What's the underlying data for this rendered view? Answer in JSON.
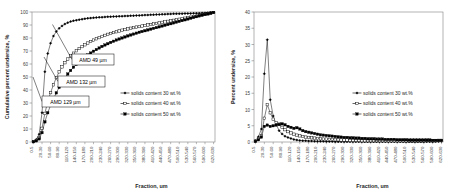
{
  "figure": {
    "background": "#ffffff",
    "line_color": "#000000",
    "axis_color": "#808080",
    "gridline_color": "#d9d9d9"
  },
  "panels": [
    {
      "id": "left",
      "name": "cumulative-undersize-chart",
      "chart_index": 0
    },
    {
      "id": "right",
      "name": "percent-undersize-chart",
      "chart_index": 1
    }
  ],
  "chart_data": [
    {
      "type": "line",
      "title": "",
      "xlabel": "Fraction, um",
      "ylabel": "Cumulative percent undersize, %",
      "ylim": [
        0,
        100
      ],
      "yticks": [
        0,
        10,
        20,
        30,
        40,
        50,
        60,
        70,
        80,
        90,
        100
      ],
      "grid": false,
      "legend_position": "center-right",
      "categories": [
        "0-5",
        "20-30",
        "50-60",
        "80-90",
        "110-120",
        "140-150",
        "170-180",
        "200-210",
        "230-240",
        "260-270",
        "290-300",
        "320-330",
        "350-360",
        "380-390",
        "410-420",
        "440-450",
        "470-480",
        "500-510",
        "530-540",
        "560-570",
        "590-600",
        "620-630"
      ],
      "x_tick_every": 3,
      "x_points": 64,
      "series": [
        {
          "name": "solids content 30 wt.%",
          "marker": "diamond",
          "values": [
            0.4,
            2.0,
            6.0,
            22.5,
            54.0,
            68.0,
            76.0,
            81.5,
            85.0,
            87.5,
            89.3,
            90.7,
            91.8,
            92.6,
            93.2,
            93.7,
            94.1,
            94.5,
            94.8,
            95.1,
            95.3,
            95.5,
            95.7,
            95.9,
            96.0,
            96.2,
            96.3,
            96.4,
            96.5,
            96.6,
            96.7,
            96.8,
            96.9,
            97.0,
            97.1,
            97.2,
            97.3,
            97.4,
            97.5,
            97.6,
            97.7,
            97.8,
            97.9,
            98.0,
            98.1,
            98.2,
            98.3,
            98.4,
            98.5,
            98.6,
            98.65,
            98.7,
            98.75,
            98.8,
            98.85,
            98.9,
            98.95,
            99.0,
            99.1,
            99.2,
            99.3,
            99.45,
            99.6,
            99.8
          ]
        },
        {
          "name": "solids content 40 wt.%",
          "marker": "square-open",
          "values": [
            0.3,
            1.2,
            3.2,
            10.5,
            22.0,
            31.0,
            38.0,
            44.0,
            49.5,
            54.0,
            57.8,
            61.0,
            63.8,
            66.2,
            68.3,
            70.2,
            71.9,
            73.4,
            74.8,
            76.1,
            77.3,
            78.4,
            79.4,
            80.3,
            81.2,
            82.0,
            82.8,
            83.5,
            84.2,
            84.8,
            85.4,
            86.0,
            86.5,
            87.0,
            87.5,
            88.0,
            88.4,
            88.8,
            89.2,
            89.6,
            90.0,
            90.4,
            90.8,
            91.2,
            91.6,
            92.0,
            92.4,
            92.8,
            93.2,
            93.6,
            94.0,
            94.4,
            94.8,
            95.2,
            95.6,
            96.0,
            96.4,
            96.8,
            97.3,
            97.8,
            98.2,
            98.6,
            99.1,
            99.6
          ]
        },
        {
          "name": "solids content 50 wt.%",
          "marker": "square-filled",
          "values": [
            0.2,
            0.9,
            2.4,
            7.2,
            15.5,
            22.5,
            28.2,
            33.2,
            37.8,
            42.0,
            45.8,
            49.2,
            52.3,
            55.0,
            57.5,
            59.8,
            61.8,
            63.6,
            65.3,
            66.9,
            68.4,
            69.8,
            71.1,
            72.3,
            73.5,
            74.6,
            75.6,
            76.6,
            77.5,
            78.4,
            79.2,
            80.0,
            80.8,
            81.6,
            82.3,
            83.0,
            83.7,
            84.4,
            85.0,
            85.6,
            86.2,
            86.8,
            87.4,
            88.0,
            88.6,
            89.2,
            89.8,
            90.4,
            91.0,
            91.6,
            92.2,
            92.8,
            93.4,
            94.0,
            94.6,
            95.2,
            95.8,
            96.4,
            97.0,
            97.6,
            98.1,
            98.6,
            99.1,
            99.6
          ]
        }
      ],
      "annotations": [
        {
          "label": "AMD 49 µm",
          "target_series": 0
        },
        {
          "label": "AMD 132 µm",
          "target_series": 2
        },
        {
          "label": "AMD 129 µm",
          "target_series": 1
        }
      ]
    },
    {
      "type": "line",
      "title": "",
      "xlabel": "Fraction, um",
      "ylabel": "Percent undersize, %",
      "ylim": [
        0,
        40
      ],
      "yticks": [
        0,
        5,
        10,
        15,
        20,
        25,
        30,
        35,
        40
      ],
      "grid": false,
      "legend_position": "center-right",
      "categories": [
        "0-5",
        "20-30",
        "50-60",
        "80-90",
        "110-120",
        "140-150",
        "170-180",
        "200-210",
        "230-240",
        "260-270",
        "290-300",
        "320-330",
        "350-360",
        "380-390",
        "410-420",
        "440-450",
        "470-480",
        "500-510",
        "530-540",
        "560-570",
        "590-600",
        "620-630"
      ],
      "x_tick_every": 3,
      "x_points": 64,
      "series": [
        {
          "name": "solids content 30 wt.%",
          "marker": "diamond",
          "values": [
            0.4,
            1.6,
            4.0,
            21.0,
            31.5,
            13.0,
            8.0,
            5.5,
            3.5,
            2.5,
            1.8,
            1.4,
            1.1,
            0.8,
            0.6,
            0.5,
            0.4,
            0.4,
            0.3,
            0.3,
            0.25,
            0.2,
            0.2,
            0.2,
            0.15,
            0.15,
            0.15,
            0.1,
            0.1,
            0.1,
            0.1,
            0.1,
            0.1,
            0.1,
            0.1,
            0.1,
            0.1,
            0.1,
            0.1,
            0.1,
            0.1,
            0.1,
            0.1,
            0.1,
            0.1,
            0.1,
            0.1,
            0.1,
            0.1,
            0.1,
            0.05,
            0.05,
            0.05,
            0.05,
            0.05,
            0.05,
            0.05,
            0.05,
            0.1,
            0.1,
            0.1,
            0.15,
            0.15,
            0.2
          ]
        },
        {
          "name": "solids content 40 wt.%",
          "marker": "square-open",
          "values": [
            0.3,
            1.0,
            2.0,
            7.3,
            11.5,
            9.0,
            7.0,
            6.0,
            5.5,
            4.5,
            3.8,
            3.2,
            2.8,
            2.4,
            2.1,
            1.9,
            1.7,
            1.5,
            1.4,
            1.3,
            1.2,
            1.1,
            1.0,
            0.9,
            0.9,
            0.8,
            0.8,
            0.7,
            0.7,
            0.6,
            0.6,
            0.6,
            0.5,
            0.5,
            0.5,
            0.5,
            0.4,
            0.4,
            0.4,
            0.4,
            0.4,
            0.4,
            0.4,
            0.4,
            0.4,
            0.4,
            0.4,
            0.4,
            0.4,
            0.4,
            0.4,
            0.4,
            0.4,
            0.4,
            0.4,
            0.4,
            0.4,
            0.4,
            0.5,
            0.5,
            0.4,
            0.4,
            0.5,
            0.5
          ]
        },
        {
          "name": "solids content 50 wt.%",
          "marker": "square-filled",
          "values": [
            0.2,
            0.7,
            1.5,
            4.8,
            5.2,
            4.8,
            5.0,
            5.2,
            5.4,
            5.6,
            5.3,
            4.8,
            4.5,
            4.2,
            4.4,
            4.0,
            3.5,
            3.2,
            3.0,
            2.8,
            2.6,
            2.4,
            2.2,
            2.1,
            2.0,
            1.9,
            1.8,
            1.7,
            1.6,
            1.5,
            1.4,
            1.4,
            1.3,
            1.3,
            1.2,
            1.2,
            1.1,
            1.1,
            1.0,
            1.0,
            1.0,
            0.9,
            0.9,
            0.9,
            0.8,
            0.8,
            0.8,
            0.8,
            0.7,
            0.7,
            0.7,
            0.7,
            0.6,
            0.6,
            0.6,
            0.6,
            0.6,
            0.6,
            0.6,
            0.6,
            0.5,
            0.5,
            0.5,
            0.5
          ]
        }
      ],
      "annotations": []
    }
  ]
}
